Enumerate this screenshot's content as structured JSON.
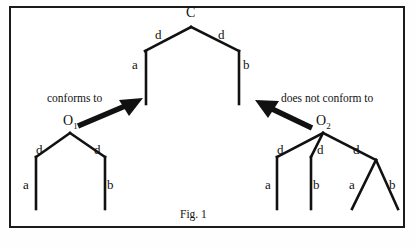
{
  "figure": {
    "caption": "Fig. 1",
    "border_color": "#1b1b1b",
    "stroke_color": "#111111",
    "background": "#ffffff"
  },
  "diagram": {
    "type": "tree-conformance-diagram",
    "relations": [
      {
        "id": "conforms",
        "label": "conforms to",
        "from": "O1",
        "to": "C",
        "arrow_direction": "up-right"
      },
      {
        "id": "not-conforms",
        "label": "does not conform to",
        "from": "O2",
        "to": "C",
        "arrow_direction": "up-left"
      }
    ],
    "trees": [
      {
        "id": "C",
        "name": "schema-tree",
        "root_label": "C",
        "edge_labels": [
          "d",
          "d"
        ],
        "leaf_labels": [
          "a",
          "b"
        ]
      },
      {
        "id": "O1",
        "name": "conforming-tree",
        "root_label": "O",
        "root_subscript": "1",
        "edge_labels": [
          "d",
          "d"
        ],
        "leaf_labels": [
          "a",
          "b"
        ]
      },
      {
        "id": "O2",
        "name": "non-conforming-tree",
        "root_label": "O",
        "root_subscript": "2",
        "edge_labels": [
          "d",
          "d",
          "d"
        ],
        "leaf_labels": [
          "a",
          "b",
          "a",
          "b"
        ]
      }
    ]
  },
  "labels": {
    "c_root": "C",
    "c_edge_left": "d",
    "c_edge_right": "d",
    "c_leaf_left": "a",
    "c_leaf_right": "b",
    "o1_root": "O",
    "o1_sub": "1",
    "o1_edge_left": "d",
    "o1_edge_right": "d",
    "o1_leaf_left": "a",
    "o1_leaf_right": "b",
    "o2_root": "O",
    "o2_sub": "2",
    "o2_edge_left": "d",
    "o2_edge_mid": "d",
    "o2_edge_right": "d",
    "o2_leaf_1": "a",
    "o2_leaf_2": "b",
    "o2_leaf_3": "a",
    "o2_leaf_4": "b",
    "rel_left": "conforms to",
    "rel_right": "does not conform to",
    "caption": "Fig. 1"
  }
}
